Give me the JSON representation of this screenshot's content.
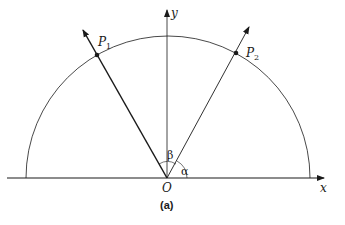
{
  "figure": {
    "caption": "(a)",
    "labels": {
      "x_axis": "x",
      "y_axis": "y",
      "origin": "O",
      "point1": "P",
      "point1_sub": "1",
      "point2": "P",
      "point2_sub": "2",
      "angle_alpha": "α",
      "angle_beta": "β"
    },
    "colors": {
      "stroke": "#1a1a1a",
      "background": "#ffffff"
    },
    "geometry": {
      "origin": [
        167,
        178
      ],
      "radius": 142,
      "x_axis_range": [
        7,
        325
      ],
      "y_axis_top": 10,
      "P1": [
        97,
        55
      ],
      "P2": [
        236,
        53
      ]
    }
  }
}
